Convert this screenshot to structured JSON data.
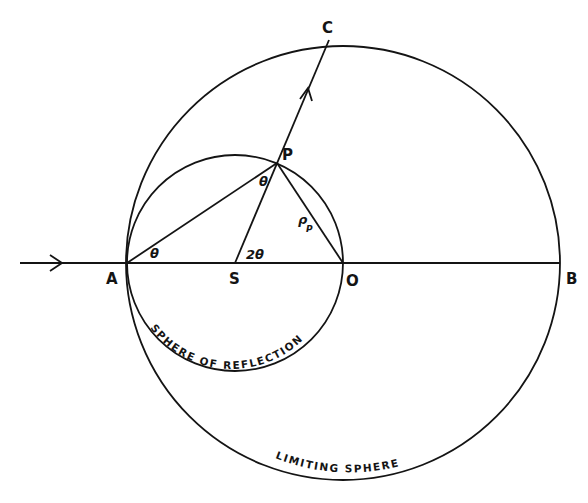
{
  "diagram": {
    "colors": {
      "ink": "#141414",
      "paper": "#ffffff"
    },
    "points": {
      "A": {
        "label": "A",
        "x": 127,
        "y": 263
      },
      "S": {
        "label": "S",
        "x": 235,
        "y": 263
      },
      "O": {
        "label": "O",
        "x": 343,
        "y": 263
      },
      "B": {
        "label": "B",
        "x": 560,
        "y": 263
      },
      "P": {
        "label": "P",
        "x": 277,
        "y": 163
      },
      "C": {
        "label": "C",
        "x": 329,
        "y": 40
      }
    },
    "circles": {
      "sphere_of_reflection": {
        "label": "SPHERE OF REFLECTION",
        "cx": 235,
        "cy": 263,
        "r": 108
      },
      "limiting_sphere": {
        "label": "LIMITING SPHERE",
        "cx": 343,
        "cy": 263,
        "r": 217
      }
    },
    "angles": {
      "at_A": "θ",
      "at_P": "θ",
      "at_S": "2θ"
    },
    "vectors": {
      "OP": {
        "label": "ρ",
        "subscript": "P"
      }
    },
    "arrows": {
      "incident": "incident beam along AB, arrow pointing right",
      "diffracted": "diffracted beam from S through P to C, arrow pointing toward C"
    }
  }
}
